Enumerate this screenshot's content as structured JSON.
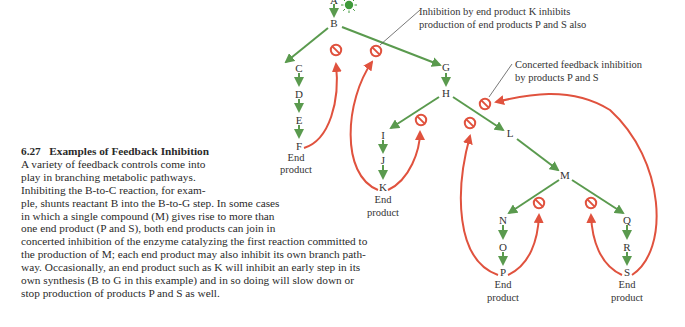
{
  "figure": {
    "number": "6.27",
    "title": "Examples of Feedback Inhibition",
    "caption_lines": [
      "A variety of feedback controls come into",
      "play in branching metabolic pathways.",
      "Inhibiting the B-to-C reaction, for exam-",
      "ple, shunts reactant B into the B-to-G step. In some cases",
      "in which a single compound (M) gives rise to more than",
      "one end product (P and S), both end products can join in",
      "concerted inhibition of the enzyme catalyzing the first reaction committed to",
      "the production of M; each end product may also inhibit its own branch path-",
      "way. Occasionally, an end product such as K will inhibit an early step in its",
      "own synthesis (B to G in this example) and in so doing will slow down or",
      "stop production of products P and S as well."
    ]
  },
  "colors": {
    "pathway_arrow": "#5a9a4e",
    "inhibition_arrow": "#e0523e",
    "inhibition_symbol": "#e0523e",
    "signal_icon": "#3f9a3a",
    "text": "#2a2a2a",
    "callout_line": "#555555"
  },
  "nodes": {
    "A": "A",
    "B": "B",
    "C": "C",
    "D": "D",
    "E": "E",
    "F": "F",
    "G": "G",
    "H": "H",
    "I": "I",
    "J": "J",
    "K": "K",
    "L": "L",
    "M": "M",
    "N": "N",
    "O": "O",
    "P": "P",
    "Q": "Q",
    "R": "R",
    "S": "S"
  },
  "end_product_label": {
    "line1": "End",
    "line2": "product"
  },
  "annotations": {
    "k_inhibition": {
      "line1": "Inhibition by end product K inhibits",
      "line2": "production of end products P and S also"
    },
    "concerted": {
      "line1": "Concerted feedback inhibition",
      "line2": "by products P and S"
    }
  },
  "icons": {
    "signal": "sunburst-icon",
    "inhibition": "no-entry-icon"
  }
}
